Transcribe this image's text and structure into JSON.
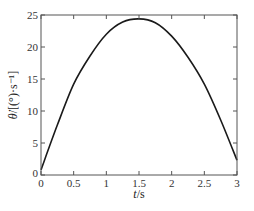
{
  "chart_data": {
    "type": "line",
    "title": "",
    "xlabel": "t/s",
    "ylabel": "θ̇/[(°)·s⁻¹]",
    "xlim": [
      0,
      3
    ],
    "ylim": [
      0,
      25
    ],
    "xticks": [
      0,
      0.5,
      1,
      1.5,
      2,
      2.5,
      3
    ],
    "xtick_labels": [
      "0",
      "0.5",
      "1",
      "1.5",
      "2",
      "2.5",
      "3"
    ],
    "yticks": [
      0,
      5,
      10,
      15,
      20,
      25
    ],
    "ytick_labels": [
      "0",
      "5",
      "10",
      "15",
      "20",
      "25"
    ],
    "grid": false,
    "legend": null,
    "series": [
      {
        "name": "angular velocity",
        "color": "#1a1a1a",
        "x": [
          0,
          0.25,
          0.5,
          0.75,
          1.0,
          1.25,
          1.5,
          1.75,
          2.0,
          2.25,
          2.5,
          2.75,
          3.0
        ],
        "values": [
          0.8,
          7.8,
          14.2,
          18.6,
          22.0,
          23.9,
          24.4,
          23.8,
          21.7,
          18.4,
          14.2,
          8.6,
          2.3
        ]
      }
    ]
  },
  "labels": {
    "xlabel_italic": "t",
    "xlabel_rest": "/s",
    "ylabel_theta": "θ̇",
    "ylabel_rest": "/[(°)·s⁻¹]"
  },
  "colors": {
    "axis": "#555555",
    "line": "#1a1a1a"
  }
}
